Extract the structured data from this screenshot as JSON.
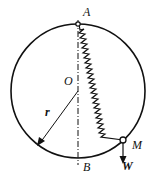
{
  "figure": {
    "labels": {
      "top_point": "A",
      "bottom_point": "B",
      "center": "O",
      "radius": "r",
      "mass_point": "M",
      "weight": "W"
    },
    "caption": ""
  }
}
